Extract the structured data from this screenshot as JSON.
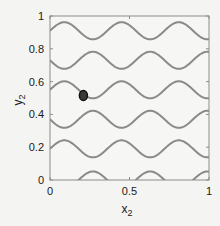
{
  "chart_data": {
    "type": "line",
    "title": "",
    "xlabel": "x",
    "xlabel_sub": "2",
    "ylabel": "y",
    "ylabel_sub": "2",
    "xlim": [
      0,
      1
    ],
    "ylim": [
      0,
      1
    ],
    "grid": false,
    "legend": null,
    "x_ticks": [
      0,
      0.5,
      1
    ],
    "x_tick_labels": [
      "0",
      "0.5",
      "1"
    ],
    "y_ticks": [
      0,
      0.2,
      0.4,
      0.6,
      0.8,
      1
    ],
    "y_tick_labels": [
      "0",
      "0.2",
      "0.4",
      "0.6",
      "0.8",
      "1"
    ],
    "curve_color": "#8a8a8a",
    "curve_width": 2,
    "curve_model": "y = center + amplitude * cos(2*pi*(x - peak_x)/period)",
    "series": [
      {
        "name": "curve-1",
        "center": 0.91,
        "amplitude": 0.052,
        "period": 0.36,
        "peak_x": 0.09
      },
      {
        "name": "curve-2",
        "center": 0.73,
        "amplitude": 0.052,
        "period": 0.36,
        "peak_x": 0.27
      },
      {
        "name": "curve-3",
        "center": 0.55,
        "amplitude": 0.052,
        "period": 0.36,
        "peak_x": 0.09
      },
      {
        "name": "curve-4",
        "center": 0.37,
        "amplitude": 0.052,
        "period": 0.36,
        "peak_x": 0.27
      },
      {
        "name": "curve-5",
        "center": 0.19,
        "amplitude": 0.052,
        "period": 0.36,
        "peak_x": 0.09
      },
      {
        "name": "curve-6",
        "center": 0.0,
        "amplitude": 0.052,
        "period": 0.36,
        "peak_x": 0.27
      }
    ],
    "markers": [
      {
        "name": "current-point",
        "x": 0.21,
        "y": 0.515,
        "fill": "#3a3a3a",
        "edge": "#111111"
      }
    ]
  },
  "colors": {
    "background": "#f4f4f2",
    "axes": "#8c8c8c",
    "text": "#1a1a1a"
  }
}
